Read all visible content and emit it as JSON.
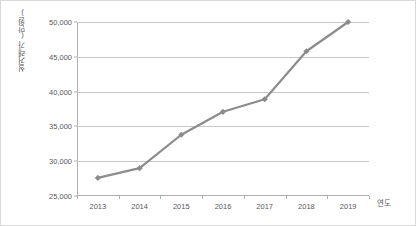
{
  "chart_data": {
    "type": "line",
    "title": "",
    "xlabel": "연도",
    "ylabel": "실거래가(만원)",
    "categories": [
      "2013",
      "2014",
      "2015",
      "2016",
      "2017",
      "2018",
      "2019"
    ],
    "values": [
      27600,
      29000,
      33800,
      37100,
      38900,
      45800,
      50000
    ],
    "series": [
      {
        "name": "실거래가",
        "values": [
          27600,
          29000,
          33800,
          37100,
          38900,
          45800,
          50000
        ]
      }
    ],
    "ylim": [
      25000,
      50000
    ],
    "yticks": [
      25000,
      30000,
      35000,
      40000,
      45000,
      50000
    ],
    "ytick_labels": [
      "25,000",
      "30,000",
      "35,000",
      "40,000",
      "45,000",
      "50,000"
    ],
    "grid": true,
    "legend": false,
    "line_color": "#8c8c8c",
    "marker": "diamond",
    "marker_color": "#8c8c8c",
    "grid_color": "#c8c8c8",
    "text_color": "#595959",
    "background": "#ffffff",
    "border_color": "#d9d9d9"
  }
}
